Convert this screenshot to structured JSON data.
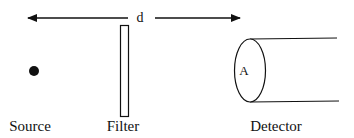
{
  "diagram": {
    "distance_label": "d",
    "aperture_label": "A",
    "labels": {
      "source": "Source",
      "filter": "Filter",
      "detector": "Detector"
    },
    "colors": {
      "stroke": "#111111",
      "background": "#ffffff"
    }
  }
}
